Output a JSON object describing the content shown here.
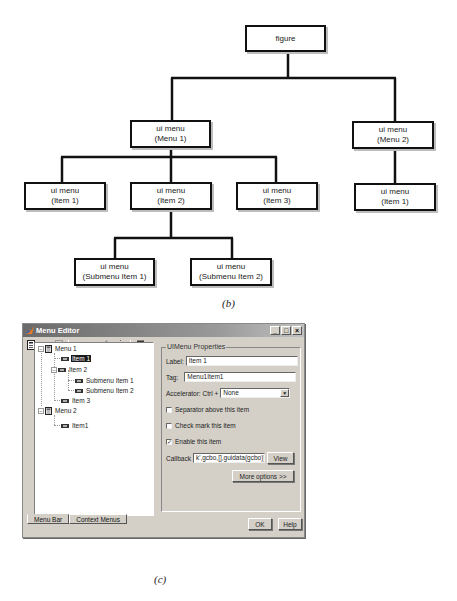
{
  "diagram": {
    "caption": "(b)",
    "nodes": {
      "figure": {
        "line1": "figure"
      },
      "menu1": {
        "line1": "ui menu",
        "line2": "(Menu 1)"
      },
      "menu2": {
        "line1": "ui menu",
        "line2": "(Menu 2)"
      },
      "m1_item1": {
        "line1": "ui menu",
        "line2": "(Item 1)"
      },
      "m1_item2": {
        "line1": "ui menu",
        "line2": "(Item 2)"
      },
      "m1_item3": {
        "line1": "ui menu",
        "line2": "(Item 3)"
      },
      "m2_item1": {
        "line1": "ui menu",
        "line2": "(Item 1)"
      },
      "sub1": {
        "line1": "ui menu",
        "line2": "(Submenu Item 1)"
      },
      "sub2": {
        "line1": "ui menu",
        "line2": "(Submenu Item 2)"
      }
    },
    "edges": [
      [
        "figure",
        "menu1"
      ],
      [
        "figure",
        "menu2"
      ],
      [
        "menu1",
        "m1_item1"
      ],
      [
        "menu1",
        "m1_item2"
      ],
      [
        "menu1",
        "m1_item3"
      ],
      [
        "menu2",
        "m2_item1"
      ],
      [
        "m1_item2",
        "sub1"
      ],
      [
        "m1_item2",
        "sub2"
      ]
    ]
  },
  "menu_editor": {
    "caption": "(c)",
    "window": {
      "title": "Menu Editor",
      "buttons": {
        "minimize": "_",
        "maximize": "□",
        "close": "×"
      }
    },
    "toolbar": [
      "new-menu-icon",
      "new-menu-item-icon",
      "new-context-menu-icon",
      "move-left-icon",
      "move-right-icon",
      "move-up-icon",
      "move-down-icon",
      "delete-icon"
    ],
    "tree": {
      "items": [
        {
          "label": "Menu 1",
          "type": "menu",
          "level": 0,
          "expanded": true
        },
        {
          "label": "Item 1",
          "type": "item",
          "level": 1,
          "selected": true
        },
        {
          "label": "Item 2",
          "type": "item",
          "level": 1,
          "expanded": true
        },
        {
          "label": "Submenu Item 1",
          "type": "item",
          "level": 2
        },
        {
          "label": "Submenu Item 2",
          "type": "item",
          "level": 2
        },
        {
          "label": "Item 3",
          "type": "item",
          "level": 1
        },
        {
          "label": "Menu 2",
          "type": "menu",
          "level": 0,
          "expanded": true
        },
        {
          "label": "Item1",
          "type": "item",
          "level": 1
        }
      ]
    },
    "tabs": [
      {
        "label": "Menu Bar",
        "active": true
      },
      {
        "label": "Context Menus",
        "active": false
      }
    ],
    "properties": {
      "group_title": "UIMenu Properties",
      "label_label": "Label:",
      "label_value": "Item 1",
      "tag_label": "Tag:",
      "tag_value": "Menu1Item1",
      "accelerator_label": "Accelerator: Ctrl +",
      "accelerator_value": "None",
      "separator_label": "Separator above this item",
      "separator_checked": false,
      "checkmark_label": "Check mark this item",
      "checkmark_checked": false,
      "enable_label": "Enable this item",
      "enable_checked": true,
      "callback_label": "Callback",
      "callback_value": "k',gcbo,[],guidata(gcbo))",
      "view_button": "View",
      "more_options_button": "More options >>"
    },
    "ok_button": "OK",
    "help_button": "Help"
  }
}
